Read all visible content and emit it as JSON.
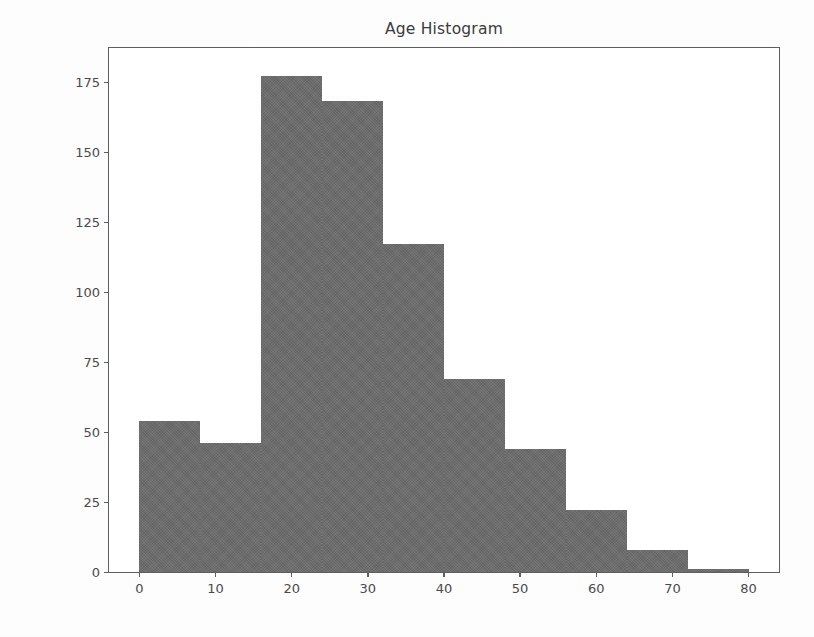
{
  "chart_data": {
    "type": "bar",
    "title": "Age Histogram",
    "xlabel": "",
    "ylabel": "",
    "grid": false,
    "legend": null,
    "xlim": [
      -4,
      84
    ],
    "ylim": [
      0,
      187
    ],
    "xticks": [
      0,
      10,
      20,
      30,
      40,
      50,
      60,
      70,
      80
    ],
    "yticks": [
      0,
      25,
      50,
      75,
      100,
      125,
      150,
      175
    ],
    "bin_edges": [
      0,
      8,
      16,
      24,
      32,
      40,
      48,
      56,
      64,
      72,
      80
    ],
    "categories": [
      "0-8",
      "8-16",
      "16-24",
      "24-32",
      "32-40",
      "40-48",
      "48-56",
      "56-64",
      "64-72",
      "72-80"
    ],
    "values": [
      54,
      46,
      177,
      168,
      117,
      69,
      44,
      22,
      8,
      1
    ],
    "bar_color": "#6b6b6b",
    "axis_color": "#5e5e5e",
    "background_color": "#ffffff"
  }
}
